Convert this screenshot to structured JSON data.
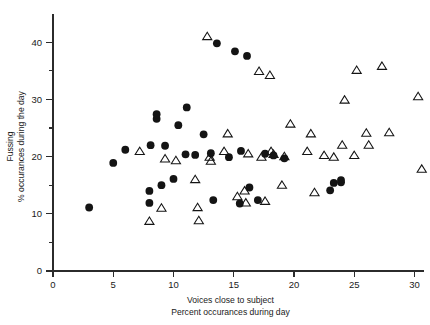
{
  "chart_data": {
    "type": "scatter",
    "title": "",
    "xlabel": "Voices close to subject",
    "xlabel_line2": "Percent occurances during day",
    "ylabel": "Fussing",
    "ylabel_line2": "% occurances during the day",
    "xlim": [
      0,
      31.5
    ],
    "ylim": [
      0,
      44
    ],
    "grid": false,
    "legend": "none",
    "x_ticks_major": [
      0,
      5,
      10,
      15,
      20,
      25,
      30
    ],
    "x_tick_labels": [
      "0",
      "5",
      "10",
      "15",
      "20",
      "25",
      "30"
    ],
    "y_ticks_major": [
      0,
      10,
      20,
      30,
      40
    ],
    "y_tick_labels": [
      "0",
      "10",
      "20",
      "30",
      "40"
    ],
    "y_ticks_minor": [
      5,
      15,
      25,
      35
    ],
    "series": [
      {
        "name": "filled-circle",
        "marker": "filled-circle",
        "color": "#141414",
        "points": [
          [
            3.0,
            11.1
          ],
          [
            5.0,
            18.9
          ],
          [
            6.0,
            21.2
          ],
          [
            8.0,
            11.9
          ],
          [
            8.0,
            14.0
          ],
          [
            8.1,
            22.0
          ],
          [
            8.6,
            26.6
          ],
          [
            8.6,
            27.4
          ],
          [
            9.0,
            15.0
          ],
          [
            9.3,
            21.9
          ],
          [
            10.0,
            16.1
          ],
          [
            10.4,
            25.5
          ],
          [
            11.0,
            20.4
          ],
          [
            11.1,
            28.6
          ],
          [
            11.8,
            20.3
          ],
          [
            12.5,
            23.9
          ],
          [
            13.1,
            20.6
          ],
          [
            13.3,
            12.4
          ],
          [
            13.6,
            39.8
          ],
          [
            14.6,
            19.9
          ],
          [
            15.1,
            38.4
          ],
          [
            15.5,
            11.8
          ],
          [
            15.6,
            21.0
          ],
          [
            16.1,
            37.6
          ],
          [
            16.3,
            14.6
          ],
          [
            17.0,
            12.4
          ],
          [
            17.6,
            20.5
          ],
          [
            18.3,
            20.2
          ],
          [
            19.2,
            19.7
          ],
          [
            23.0,
            14.1
          ],
          [
            23.3,
            15.4
          ],
          [
            23.9,
            15.5
          ],
          [
            23.9,
            15.9
          ]
        ]
      },
      {
        "name": "open-triangle",
        "marker": "open-triangle",
        "color": "#141414",
        "points": [
          [
            7.2,
            20.9
          ],
          [
            8.0,
            8.7
          ],
          [
            9.0,
            11.0
          ],
          [
            9.3,
            19.6
          ],
          [
            10.2,
            19.3
          ],
          [
            11.8,
            16.0
          ],
          [
            12.0,
            11.1
          ],
          [
            12.1,
            8.8
          ],
          [
            12.8,
            41.0
          ],
          [
            13.0,
            19.9
          ],
          [
            13.1,
            19.2
          ],
          [
            14.2,
            20.9
          ],
          [
            14.5,
            24.0
          ],
          [
            15.3,
            13.0
          ],
          [
            15.9,
            14.0
          ],
          [
            16.0,
            11.9
          ],
          [
            16.2,
            20.5
          ],
          [
            17.1,
            34.9
          ],
          [
            17.3,
            19.9
          ],
          [
            17.6,
            12.2
          ],
          [
            18.0,
            34.2
          ],
          [
            18.1,
            20.9
          ],
          [
            18.3,
            20.4
          ],
          [
            19.0,
            15.0
          ],
          [
            19.2,
            20.0
          ],
          [
            19.7,
            25.7
          ],
          [
            21.1,
            20.9
          ],
          [
            21.4,
            24.0
          ],
          [
            21.7,
            13.7
          ],
          [
            22.5,
            20.2
          ],
          [
            23.3,
            19.9
          ],
          [
            24.0,
            22.0
          ],
          [
            24.2,
            29.9
          ],
          [
            25.0,
            20.2
          ],
          [
            25.2,
            35.1
          ],
          [
            26.0,
            24.1
          ],
          [
            26.2,
            22.0
          ],
          [
            27.3,
            35.8
          ],
          [
            27.9,
            24.2
          ],
          [
            30.3,
            30.5
          ],
          [
            30.6,
            17.8
          ]
        ]
      }
    ]
  }
}
